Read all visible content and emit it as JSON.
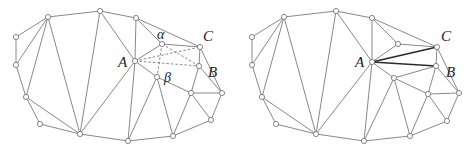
{
  "figure": {
    "panels": [
      {
        "id": "before-flip",
        "labels": {
          "A": "A",
          "B": "B",
          "C": "C",
          "alpha": "α",
          "beta": "β"
        },
        "label_positions": {
          "A": [
            118,
            66
          ],
          "B": [
            208,
            77
          ],
          "C": [
            203,
            41
          ],
          "alpha": [
            158,
            38
          ],
          "beta": [
            163,
            82
          ]
        },
        "vertices": [
          [
            16,
            37
          ],
          [
            16,
            65
          ],
          [
            48,
            17
          ],
          [
            26,
            97
          ],
          [
            40,
            124
          ],
          [
            80,
            134
          ],
          [
            100,
            11
          ],
          [
            136,
            18
          ],
          [
            135,
            61
          ],
          [
            162,
            44
          ],
          [
            200,
            47
          ],
          [
            199,
            66
          ],
          [
            157,
            77
          ],
          [
            191,
            93
          ],
          [
            222,
            93
          ],
          [
            211,
            120
          ],
          [
            173,
            136
          ],
          [
            128,
            141
          ]
        ],
        "edges": [
          [
            0,
            1
          ],
          [
            0,
            2
          ],
          [
            1,
            2
          ],
          [
            1,
            3
          ],
          [
            2,
            3
          ],
          [
            2,
            6
          ],
          [
            2,
            5
          ],
          [
            3,
            4
          ],
          [
            3,
            5
          ],
          [
            4,
            5
          ],
          [
            5,
            6
          ],
          [
            5,
            8
          ],
          [
            5,
            17
          ],
          [
            6,
            7
          ],
          [
            6,
            8
          ],
          [
            7,
            8
          ],
          [
            7,
            9
          ],
          [
            7,
            10
          ],
          [
            8,
            9
          ],
          [
            8,
            12
          ],
          [
            8,
            17
          ],
          [
            9,
            10
          ],
          [
            10,
            11
          ],
          [
            10,
            14
          ],
          [
            11,
            14
          ],
          [
            11,
            13
          ],
          [
            12,
            13
          ],
          [
            12,
            17
          ],
          [
            12,
            16
          ],
          [
            13,
            14
          ],
          [
            13,
            15
          ],
          [
            13,
            16
          ],
          [
            14,
            15
          ],
          [
            15,
            16
          ],
          [
            16,
            17
          ]
        ],
        "dashed_edges": [
          [
            8,
            10
          ],
          [
            8,
            11
          ],
          [
            9,
            12
          ],
          [
            9,
            11
          ]
        ],
        "bold_edges": []
      },
      {
        "id": "after-flip",
        "offset_x": 236,
        "labels": {
          "A": "A",
          "B": "B",
          "C": "C"
        },
        "label_positions": {
          "A": [
            355,
            66
          ],
          "B": [
            446,
            77
          ],
          "C": [
            441,
            41
          ]
        },
        "vertices": [
          [
            16,
            37
          ],
          [
            16,
            65
          ],
          [
            48,
            17
          ],
          [
            26,
            97
          ],
          [
            40,
            124
          ],
          [
            80,
            134
          ],
          [
            100,
            11
          ],
          [
            136,
            18
          ],
          [
            136,
            62
          ],
          [
            162,
            44
          ],
          [
            201,
            47
          ],
          [
            200,
            66
          ],
          [
            158,
            78
          ],
          [
            192,
            94
          ],
          [
            223,
            93
          ],
          [
            211,
            121
          ],
          [
            174,
            136
          ],
          [
            128,
            141
          ]
        ],
        "edges": [
          [
            0,
            1
          ],
          [
            0,
            2
          ],
          [
            1,
            2
          ],
          [
            1,
            3
          ],
          [
            2,
            3
          ],
          [
            2,
            6
          ],
          [
            2,
            5
          ],
          [
            3,
            4
          ],
          [
            3,
            5
          ],
          [
            4,
            5
          ],
          [
            5,
            6
          ],
          [
            5,
            8
          ],
          [
            5,
            17
          ],
          [
            6,
            7
          ],
          [
            6,
            8
          ],
          [
            7,
            8
          ],
          [
            7,
            9
          ],
          [
            7,
            10
          ],
          [
            8,
            9
          ],
          [
            8,
            12
          ],
          [
            8,
            17
          ],
          [
            9,
            10
          ],
          [
            10,
            11
          ],
          [
            10,
            14
          ],
          [
            11,
            14
          ],
          [
            11,
            13
          ],
          [
            11,
            12
          ],
          [
            12,
            13
          ],
          [
            12,
            17
          ],
          [
            12,
            16
          ],
          [
            13,
            14
          ],
          [
            13,
            15
          ],
          [
            13,
            16
          ],
          [
            14,
            15
          ],
          [
            15,
            16
          ],
          [
            16,
            17
          ]
        ],
        "dashed_edges": [],
        "bold_edges": [
          [
            8,
            10
          ],
          [
            8,
            11
          ]
        ]
      }
    ]
  }
}
